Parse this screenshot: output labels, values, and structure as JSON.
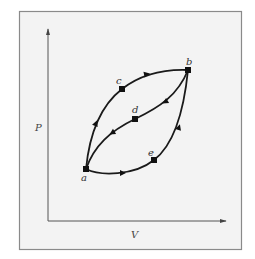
{
  "diagram": {
    "type": "P-V thermodynamic process diagram",
    "axes": {
      "y_label": "P",
      "x_label": "V"
    },
    "points": {
      "a": "a",
      "b": "b",
      "c": "c",
      "d": "d",
      "e": "e"
    },
    "paths": [
      {
        "name": "a-c-b",
        "from": "a",
        "via": "c",
        "to": "b",
        "direction": "a to b (upper curve)"
      },
      {
        "name": "b-d-a",
        "from": "b",
        "via": "d",
        "to": "a",
        "direction": "b to a (middle curve)"
      },
      {
        "name": "a-e-b",
        "from": "a",
        "via": "e",
        "to": "b",
        "direction": "a to b (lower curve)"
      }
    ],
    "colors": {
      "frame_bg": "#f3f3f3",
      "frame_border": "#8a8a8a",
      "curve": "#1a1a1a"
    }
  }
}
